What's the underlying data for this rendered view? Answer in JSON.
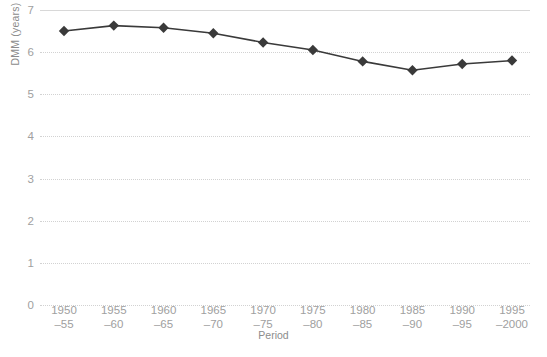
{
  "chart_data": {
    "type": "line",
    "title": "",
    "xlabel": "Period",
    "ylabel": "DMM (years)",
    "ylim": [
      0,
      7
    ],
    "ytick_labels": [
      "7",
      "6",
      "5",
      "4",
      "3",
      "2",
      "1",
      "0"
    ],
    "yticks": [
      7,
      6,
      5,
      4,
      3,
      2,
      1,
      0
    ],
    "grid": true,
    "grid_style": "dotted",
    "legend": "none",
    "categories": [
      "1950–55",
      "1955–60",
      "1960–65",
      "1965–70",
      "1970–75",
      "1975–80",
      "1980–85",
      "1985–90",
      "1990–95",
      "1995–2000"
    ],
    "tick_lines": [
      {
        "top": "1950",
        "bottom": "–55"
      },
      {
        "top": "1955",
        "bottom": "–60"
      },
      {
        "top": "1960",
        "bottom": "–65"
      },
      {
        "top": "1965",
        "bottom": "–70"
      },
      {
        "top": "1970",
        "bottom": "–75"
      },
      {
        "top": "1975",
        "bottom": "–80"
      },
      {
        "top": "1980",
        "bottom": "–85"
      },
      {
        "top": "1985",
        "bottom": "–90"
      },
      {
        "top": "1990",
        "bottom": "–95"
      },
      {
        "top": "1995",
        "bottom": "–2000"
      }
    ],
    "values": [
      6.5,
      6.63,
      6.58,
      6.45,
      6.23,
      6.05,
      5.78,
      5.57,
      5.72,
      5.8
    ],
    "series": [
      {
        "name": "DMM",
        "values": [
          6.5,
          6.63,
          6.58,
          6.45,
          6.23,
          6.05,
          5.78,
          5.57,
          5.72,
          5.8
        ]
      }
    ],
    "marker": "diamond",
    "line_color": "#3a3a3a",
    "marker_color": "#3a3a3a",
    "grid_color": "#d2d2d2",
    "tick_label_color": "#a0a0a0",
    "axis_title_color": "#8c8c8c"
  },
  "caption": {
    "text": ""
  }
}
